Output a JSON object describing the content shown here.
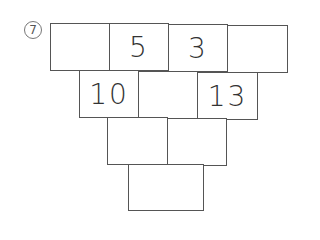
{
  "problem": {
    "number_label": "⑦",
    "rows": [
      {
        "cells": [
          "",
          "5",
          "3",
          ""
        ]
      },
      {
        "cells": [
          "10",
          "",
          "13"
        ]
      },
      {
        "cells": [
          "",
          ""
        ]
      },
      {
        "cells": [
          ""
        ]
      }
    ]
  }
}
